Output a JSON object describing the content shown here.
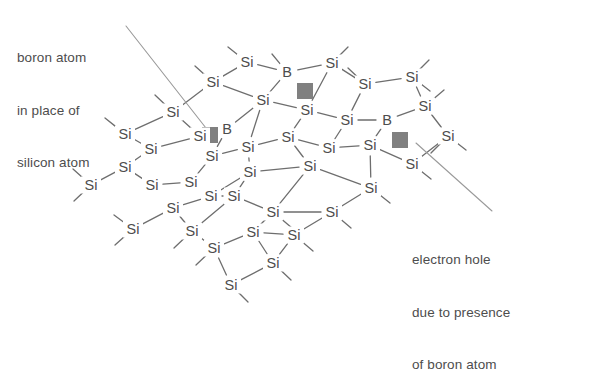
{
  "figure": {
    "background_color": "#ffffff",
    "atom_text_color": "#4d4d4d",
    "bond_color": "#6e6e6e",
    "leader_color": "#9a9a9a",
    "hole_color": "#808080"
  },
  "annotations": {
    "boron": {
      "name": "boron-atom-callout",
      "lines": [
        "boron atom",
        "in place of",
        "silicon atom"
      ],
      "leader": {
        "x1": 126,
        "y1": 26,
        "x2": 213,
        "y2": 137
      }
    },
    "hole": {
      "name": "electron-hole-callout",
      "lines": [
        "electron hole",
        "due to presence",
        "of boron atom"
      ],
      "leader": {
        "x1": 416,
        "y1": 143,
        "x2": 492,
        "y2": 211
      }
    }
  },
  "lattice": {
    "silicon_label": "Si",
    "boron_label": "B",
    "atoms": [
      {
        "id": "a0",
        "label": "Si",
        "x": 213,
        "y": 82
      },
      {
        "id": "a1",
        "label": "Si",
        "x": 247,
        "y": 62
      },
      {
        "id": "a2",
        "label": "B",
        "x": 287,
        "y": 72
      },
      {
        "id": "a3",
        "label": "Si",
        "x": 332,
        "y": 63
      },
      {
        "id": "a4",
        "label": "Si",
        "x": 365,
        "y": 84
      },
      {
        "id": "a5",
        "label": "Si",
        "x": 412,
        "y": 77
      },
      {
        "id": "a6",
        "label": "Si",
        "x": 173,
        "y": 112
      },
      {
        "id": "a7",
        "label": "Si",
        "x": 200,
        "y": 136
      },
      {
        "id": "a8",
        "label": "B",
        "x": 227,
        "y": 129
      },
      {
        "id": "a9",
        "label": "Si",
        "x": 263,
        "y": 100
      },
      {
        "id": "a10",
        "label": "Si",
        "x": 307,
        "y": 110
      },
      {
        "id": "a11",
        "label": "Si",
        "x": 347,
        "y": 120
      },
      {
        "id": "a12",
        "label": "B",
        "x": 387,
        "y": 120
      },
      {
        "id": "a13",
        "label": "Si",
        "x": 425,
        "y": 106
      },
      {
        "id": "a14",
        "label": "Si",
        "x": 448,
        "y": 136
      },
      {
        "id": "a15",
        "label": "Si",
        "x": 125,
        "y": 134
      },
      {
        "id": "a16",
        "label": "Si",
        "x": 151,
        "y": 149
      },
      {
        "id": "a17",
        "label": "Si",
        "x": 125,
        "y": 167
      },
      {
        "id": "a18",
        "label": "Si",
        "x": 91,
        "y": 185
      },
      {
        "id": "a19",
        "label": "Si",
        "x": 212,
        "y": 156
      },
      {
        "id": "a20",
        "label": "Si",
        "x": 248,
        "y": 147
      },
      {
        "id": "a21",
        "label": "Si",
        "x": 288,
        "y": 137
      },
      {
        "id": "a22",
        "label": "Si",
        "x": 329,
        "y": 148
      },
      {
        "id": "a23",
        "label": "Si",
        "x": 370,
        "y": 145
      },
      {
        "id": "a24",
        "label": "Si",
        "x": 412,
        "y": 164
      },
      {
        "id": "a25",
        "label": "Si",
        "x": 152,
        "y": 185
      },
      {
        "id": "a26",
        "label": "Si",
        "x": 191,
        "y": 182
      },
      {
        "id": "a27",
        "label": "Si",
        "x": 211,
        "y": 196
      },
      {
        "id": "a28",
        "label": "Si",
        "x": 250,
        "y": 172
      },
      {
        "id": "a29",
        "label": "Si",
        "x": 310,
        "y": 166
      },
      {
        "id": "a30",
        "label": "Si",
        "x": 371,
        "y": 188
      },
      {
        "id": "a31",
        "label": "Si",
        "x": 173,
        "y": 208
      },
      {
        "id": "a32",
        "label": "Si",
        "x": 133,
        "y": 229
      },
      {
        "id": "a33",
        "label": "Si",
        "x": 234,
        "y": 196
      },
      {
        "id": "a34",
        "label": "Si",
        "x": 273,
        "y": 212
      },
      {
        "id": "a35",
        "label": "Si",
        "x": 332,
        "y": 212
      },
      {
        "id": "a36",
        "label": "Si",
        "x": 192,
        "y": 231
      },
      {
        "id": "a37",
        "label": "Si",
        "x": 214,
        "y": 248
      },
      {
        "id": "a38",
        "label": "Si",
        "x": 253,
        "y": 232
      },
      {
        "id": "a39",
        "label": "Si",
        "x": 294,
        "y": 235
      },
      {
        "id": "a40",
        "label": "Si",
        "x": 273,
        "y": 263
      },
      {
        "id": "a41",
        "label": "Si",
        "x": 231,
        "y": 285
      }
    ],
    "bonds": [
      [
        "a0",
        "a1"
      ],
      [
        "a1",
        "a2"
      ],
      [
        "a2",
        "a3"
      ],
      [
        "a3",
        "a4"
      ],
      [
        "a4",
        "a5"
      ],
      [
        "a0",
        "a9"
      ],
      [
        "a9",
        "a2"
      ],
      [
        "a9",
        "a10"
      ],
      [
        "a10",
        "a3"
      ],
      [
        "a10",
        "a11"
      ],
      [
        "a11",
        "a4"
      ],
      [
        "a11",
        "a12"
      ],
      [
        "a12",
        "a13"
      ],
      [
        "a13",
        "a5"
      ],
      [
        "a13",
        "a14"
      ],
      [
        "a6",
        "a0"
      ],
      [
        "a6",
        "a7"
      ],
      [
        "a7",
        "a8"
      ],
      [
        "a8",
        "a9"
      ],
      [
        "a8",
        "a19"
      ],
      [
        "a15",
        "a6"
      ],
      [
        "a15",
        "a16"
      ],
      [
        "a16",
        "a7"
      ],
      [
        "a16",
        "a17"
      ],
      [
        "a17",
        "a18"
      ],
      [
        "a17",
        "a25"
      ],
      [
        "a19",
        "a20"
      ],
      [
        "a20",
        "a9"
      ],
      [
        "a20",
        "a21"
      ],
      [
        "a21",
        "a10"
      ],
      [
        "a21",
        "a22"
      ],
      [
        "a22",
        "a11"
      ],
      [
        "a22",
        "a23"
      ],
      [
        "a23",
        "a12"
      ],
      [
        "a23",
        "a24"
      ],
      [
        "a24",
        "a14"
      ],
      [
        "a19",
        "a26"
      ],
      [
        "a25",
        "a26"
      ],
      [
        "a26",
        "a27"
      ],
      [
        "a27",
        "a31"
      ],
      [
        "a28",
        "a20"
      ],
      [
        "a27",
        "a28"
      ],
      [
        "a28",
        "a33"
      ],
      [
        "a29",
        "a21"
      ],
      [
        "a29",
        "a28"
      ],
      [
        "a29",
        "a34"
      ],
      [
        "a30",
        "a23"
      ],
      [
        "a30",
        "a29"
      ],
      [
        "a30",
        "a35"
      ],
      [
        "a31",
        "a32"
      ],
      [
        "a31",
        "a36"
      ],
      [
        "a33",
        "a27"
      ],
      [
        "a33",
        "a36"
      ],
      [
        "a34",
        "a33"
      ],
      [
        "a34",
        "a38"
      ],
      [
        "a35",
        "a34"
      ],
      [
        "a35",
        "a39"
      ],
      [
        "a36",
        "a37"
      ],
      [
        "a37",
        "a38"
      ],
      [
        "a38",
        "a39"
      ],
      [
        "a37",
        "a41"
      ],
      [
        "a40",
        "a38"
      ],
      [
        "a40",
        "a39"
      ],
      [
        "a41",
        "a40"
      ]
    ],
    "stubs": [
      {
        "from": "a0",
        "dx": -18,
        "dy": -16
      },
      {
        "from": "a1",
        "dx": -19,
        "dy": -15
      },
      {
        "from": "a2",
        "dx": -15,
        "dy": -18
      },
      {
        "from": "a3",
        "dx": 16,
        "dy": -16
      },
      {
        "from": "a5",
        "dx": 17,
        "dy": -17
      },
      {
        "from": "a4",
        "dx": -17,
        "dy": -16
      },
      {
        "from": "a6",
        "dx": -18,
        "dy": -17
      },
      {
        "from": "a15",
        "dx": -20,
        "dy": -16
      },
      {
        "from": "a18",
        "dx": -18,
        "dy": -16
      },
      {
        "from": "a32",
        "dx": -19,
        "dy": -14
      },
      {
        "from": "a5",
        "dx": 18,
        "dy": 14
      },
      {
        "from": "a14",
        "dx": 18,
        "dy": 14
      },
      {
        "from": "a24",
        "dx": 19,
        "dy": 15
      },
      {
        "from": "a30",
        "dx": 19,
        "dy": 15
      },
      {
        "from": "a35",
        "dx": 19,
        "dy": 16
      },
      {
        "from": "a39",
        "dx": 19,
        "dy": 16
      },
      {
        "from": "a41",
        "dx": 17,
        "dy": 17
      },
      {
        "from": "a40",
        "dx": 18,
        "dy": 17
      },
      {
        "from": "a37",
        "dx": -18,
        "dy": 17
      },
      {
        "from": "a36",
        "dx": -18,
        "dy": 17
      },
      {
        "from": "a18",
        "dx": -17,
        "dy": 16
      },
      {
        "from": "a32",
        "dx": -18,
        "dy": 16
      },
      {
        "from": "a34",
        "dx": 19,
        "dy": 16
      },
      {
        "from": "a14",
        "dx": -17,
        "dy": 17
      },
      {
        "from": "a13",
        "dx": 19,
        "dy": -16
      }
    ],
    "holes": [
      {
        "name": "electron-hole-1",
        "x": 210,
        "y": 135,
        "size": 16
      },
      {
        "name": "electron-hole-2",
        "x": 305,
        "y": 91,
        "size": 16
      },
      {
        "name": "electron-hole-3",
        "x": 400,
        "y": 140,
        "size": 16
      }
    ]
  }
}
